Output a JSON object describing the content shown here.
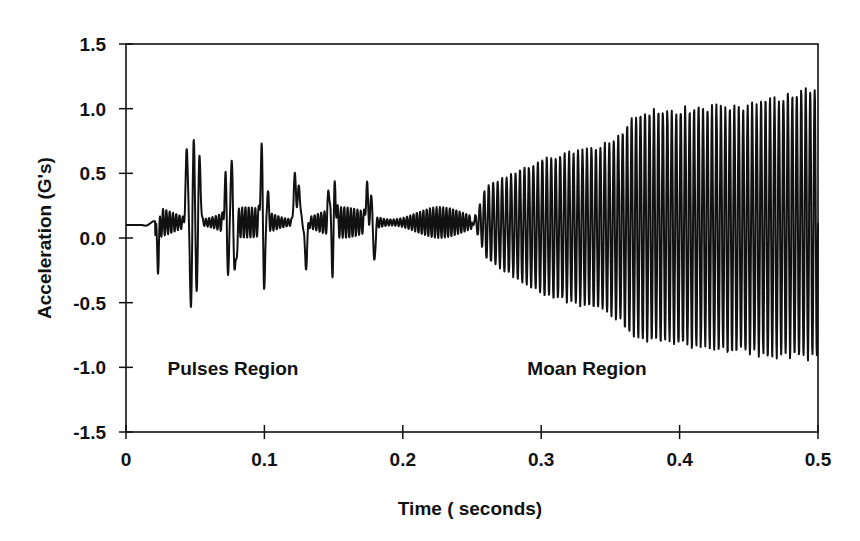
{
  "chart_data": {
    "type": "line",
    "title": "",
    "xlabel": "Time ( seconds)",
    "ylabel": "Acceleration (G's)",
    "xlim": [
      0,
      0.5
    ],
    "ylim": [
      -1.5,
      1.5
    ],
    "x_ticks": [
      "0",
      "0.1",
      "0.2",
      "0.3",
      "0.4",
      "0.5"
    ],
    "y_ticks": [
      "1.5",
      "1.0",
      "0.5",
      "0.0",
      "-0.5",
      "-1.0",
      "-1.5"
    ],
    "grid": false,
    "legend": null,
    "line_color": "#111111",
    "annotations": [
      {
        "text": "Pulses Region",
        "x": 0.03,
        "y": -1.0
      },
      {
        "text": "Moan Region",
        "x": 0.29,
        "y": -1.0
      }
    ],
    "series": [
      {
        "name": "acceleration",
        "description": "Vibration signal: flat ~0.1 G until ~0.02 s, then irregular pulses (peaks up to ~0.85, troughs ~-0.55) until ~0.25 s, then a growing near-sinusoidal oscillation (moan) whose amplitude rises from ~±0.5 at 0.25 s to ~+1.2/-0.95 at 0.5 s, ~ 310 Hz.",
        "envelope": {
          "t": [
            0.0,
            0.02,
            0.05,
            0.1,
            0.15,
            0.2,
            0.25,
            0.3,
            0.35,
            0.37,
            0.4,
            0.45,
            0.5
          ],
          "upper": [
            0.11,
            0.13,
            0.85,
            0.68,
            0.58,
            0.4,
            0.35,
            0.62,
            0.75,
            1.0,
            1.02,
            1.05,
            1.2
          ],
          "lower": [
            0.1,
            0.09,
            -0.55,
            -0.45,
            -0.3,
            -0.2,
            -0.1,
            -0.45,
            -0.6,
            -0.8,
            -0.85,
            -0.92,
            -0.97
          ]
        },
        "pulse_peaks": [
          {
            "t": 0.044,
            "v": 0.68
          },
          {
            "t": 0.049,
            "v": 0.85
          },
          {
            "t": 0.053,
            "v": 0.65
          },
          {
            "t": 0.072,
            "v": 0.46
          },
          {
            "t": 0.076,
            "v": 0.61
          },
          {
            "t": 0.098,
            "v": 0.68
          },
          {
            "t": 0.102,
            "v": 0.38
          },
          {
            "t": 0.122,
            "v": 0.48
          },
          {
            "t": 0.125,
            "v": 0.4
          },
          {
            "t": 0.147,
            "v": 0.42
          },
          {
            "t": 0.151,
            "v": 0.39
          },
          {
            "t": 0.174,
            "v": 0.38
          },
          {
            "t": 0.178,
            "v": 0.48
          }
        ],
        "pulse_troughs": [
          {
            "t": 0.023,
            "v": -0.17
          },
          {
            "t": 0.047,
            "v": -0.55
          },
          {
            "t": 0.051,
            "v": -0.5
          },
          {
            "t": 0.074,
            "v": -0.35
          },
          {
            "t": 0.079,
            "v": -0.3
          },
          {
            "t": 0.1,
            "v": -0.43
          },
          {
            "t": 0.13,
            "v": -0.22
          },
          {
            "t": 0.149,
            "v": -0.26
          },
          {
            "t": 0.179,
            "v": -0.35
          }
        ]
      }
    ]
  }
}
